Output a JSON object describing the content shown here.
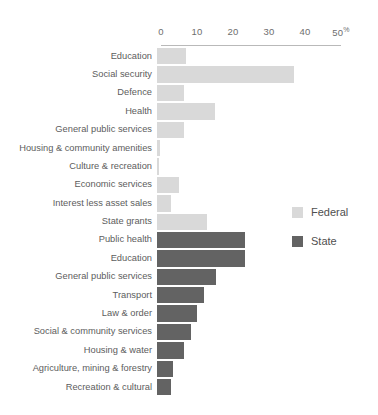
{
  "chart_data": {
    "type": "bar",
    "orientation": "horizontal",
    "title": "",
    "subtitle": "",
    "xlabel": "",
    "ylabel": "",
    "xlim": [
      0,
      50
    ],
    "xticks": [
      0,
      10,
      20,
      30,
      40,
      50
    ],
    "xtick_labels": [
      "0",
      "10",
      "20",
      "30",
      "40",
      "50"
    ],
    "xtick_suffix": "%",
    "grid": false,
    "legend_position": "right",
    "colors": {
      "federal": "#d9d9d9",
      "state": "#636363",
      "axis": "#b9b9b9",
      "text": "#5d5d5d"
    },
    "series": [
      {
        "name": "Federal",
        "color": "#d9d9d9",
        "categories": [
          "Education",
          "Social security",
          "Defence",
          "Health",
          "General public services",
          "Housing & community amenities",
          "Culture & recreation",
          "Economic services",
          "Interest less asset sales",
          "State grants"
        ],
        "values": [
          8,
          38,
          7.5,
          16,
          7.5,
          0.7,
          0.5,
          6,
          4,
          14
        ]
      },
      {
        "name": "State",
        "color": "#636363",
        "categories": [
          "Public health",
          "Education",
          "General public services",
          "Transport",
          "Law & order",
          "Social & community services",
          "Housing & water",
          "Agriculture, mining & forestry",
          "Recreation & cultural"
        ],
        "values": [
          24.5,
          24.5,
          16.5,
          13,
          11,
          9.5,
          7.5,
          4.5,
          4
        ]
      }
    ]
  },
  "legend": {
    "items": [
      {
        "label": "Federal",
        "color": "#d9d9d9"
      },
      {
        "label": "State",
        "color": "#636363"
      }
    ]
  }
}
